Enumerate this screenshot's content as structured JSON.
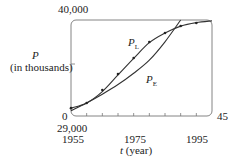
{
  "chart_data": {
    "type": "line",
    "title": "",
    "xlabel_var": "t",
    "xlabel_unit": "(year)",
    "ylabel_var": "P",
    "ylabel_unit": "(in thousands)",
    "xlim": [
      0,
      45
    ],
    "ylim": [
      29000,
      40000
    ],
    "y_tick_labels": {
      "top": "40,000",
      "bottom": "0",
      "bottom_offset": "29,000"
    },
    "x_tick_labels": [
      "1955",
      "1975",
      "1995"
    ],
    "x_right_label": "45",
    "x_ticks_years": [
      1955,
      1960,
      1965,
      1970,
      1975,
      1980,
      1985,
      1990,
      1995,
      2000
    ],
    "grid": false,
    "series": [
      {
        "name": "P_L",
        "label_main": "P",
        "label_sub": "L",
        "kind": "logistic model",
        "x": [
          0,
          5,
          10,
          15,
          20,
          25,
          30,
          35,
          40,
          45
        ],
        "values": [
          29900,
          30500,
          31800,
          33700,
          35600,
          37400,
          38500,
          39300,
          39700,
          39900
        ]
      },
      {
        "name": "P_E",
        "label_main": "P",
        "label_sub": "E",
        "kind": "exponential model",
        "x": [
          0,
          5,
          10,
          15,
          20,
          25,
          30,
          35
        ],
        "values": [
          29600,
          30500,
          31500,
          32600,
          33900,
          35400,
          37500,
          40000
        ]
      },
      {
        "name": "data",
        "kind": "scatter",
        "x": [
          0,
          5,
          10,
          15,
          20,
          25,
          30,
          35,
          40
        ],
        "values": [
          29900,
          30490,
          31980,
          33810,
          35650,
          37480,
          38510,
          39310,
          39650
        ]
      }
    ]
  }
}
